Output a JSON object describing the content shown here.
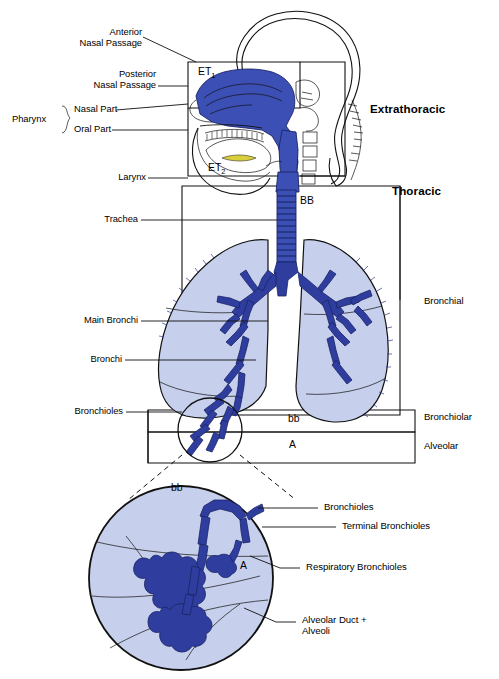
{
  "diagram": {
    "type": "anatomical-diagram",
    "colors": {
      "airway_fill": "#3c4fb5",
      "airway_dark": "#2b3a92",
      "lung_fill": "#c6cfeb",
      "outline": "#111111",
      "background": "#ffffff"
    }
  },
  "left_labels": {
    "anterior_nasal_passage": "Anterior\nNasal Passage",
    "posterior_nasal_passage": "Posterior\nNasal Passage",
    "pharynx": "Pharynx",
    "nasal_part": "Nasal Part",
    "oral_part": "Oral Part",
    "larynx": "Larynx",
    "trachea": "Trachea",
    "main_bronchi": "Main Bronchi",
    "bronchi": "Bronchi",
    "bronchioles": "Bronchioles"
  },
  "right_labels": {
    "extrathoracic": "Extrathoracic",
    "thoracic": "Thoracic",
    "bronchial": "Bronchial",
    "bronchiolar": "Bronchiolar",
    "alveolar": "Alveolar"
  },
  "region_codes": {
    "et1": "ET",
    "et1_sub": "1",
    "et2": "ET",
    "et2_sub": "2",
    "bb_upper": "BB",
    "bb_lower": "bb",
    "a_main": "A",
    "bb_inset": "bb",
    "a_inset": "A"
  },
  "inset_labels": {
    "bronchioles": "Bronchioles",
    "terminal_bronchioles": "Terminal Bronchioles",
    "respiratory_bronchioles": "Respiratory Bronchioles",
    "alveolar_duct_alveoli": "Alveolar Duct +\nAlveoli"
  }
}
